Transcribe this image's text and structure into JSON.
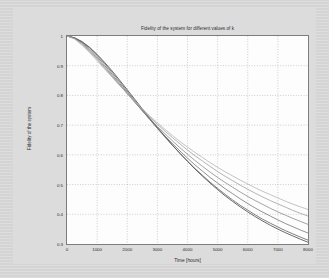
{
  "chart_data": {
    "type": "line",
    "title": "Fidelity of the system for different values of k",
    "xlabel": "Time [hours]",
    "ylabel": "Fidelity of the system",
    "xlim": [
      0,
      8000
    ],
    "ylim": [
      0.3,
      1.0
    ],
    "grid": true,
    "grid_style": "dotted",
    "legend": "none",
    "xticks": [
      0,
      1000,
      2000,
      3000,
      4000,
      5000,
      6000,
      7000,
      8000
    ],
    "xtick_labels": [
      "0",
      "1000",
      "2000",
      "3000",
      "4000",
      "5000",
      "6000",
      "7000",
      "8000"
    ],
    "yticks": [
      0.3,
      0.4,
      0.5,
      0.6,
      0.7,
      0.8,
      0.9,
      1.0
    ],
    "ytick_labels": [
      "0.3",
      "0.4",
      "0.5",
      "0.6",
      "0.7",
      "0.8",
      "0.9",
      "1"
    ],
    "x": [
      0,
      250,
      500,
      750,
      1000,
      1250,
      1500,
      1750,
      2000,
      2250,
      2500,
      2750,
      3000,
      3250,
      3500,
      3750,
      4000,
      4250,
      4500,
      4750,
      5000,
      5250,
      5500,
      5750,
      6000,
      6250,
      6500,
      6750,
      7000,
      7250,
      7500,
      7750,
      8000
    ],
    "series": [
      {
        "name": "k1",
        "color": "#3a3a3a",
        "values": [
          1.0,
          0.994,
          0.981,
          0.962,
          0.938,
          0.911,
          0.882,
          0.851,
          0.819,
          0.787,
          0.755,
          0.723,
          0.692,
          0.662,
          0.633,
          0.605,
          0.578,
          0.552,
          0.528,
          0.505,
          0.483,
          0.462,
          0.443,
          0.425,
          0.408,
          0.392,
          0.377,
          0.363,
          0.35,
          0.338,
          0.327,
          0.316,
          0.306
        ]
      },
      {
        "name": "k2",
        "color": "#555555",
        "values": [
          1.0,
          0.994,
          0.98,
          0.96,
          0.935,
          0.907,
          0.877,
          0.846,
          0.814,
          0.782,
          0.75,
          0.719,
          0.689,
          0.66,
          0.632,
          0.605,
          0.579,
          0.554,
          0.531,
          0.508,
          0.487,
          0.467,
          0.448,
          0.43,
          0.414,
          0.398,
          0.383,
          0.37,
          0.357,
          0.345,
          0.334,
          0.323,
          0.313
        ]
      },
      {
        "name": "k3",
        "color": "#6e6e6e",
        "values": [
          1.0,
          0.993,
          0.978,
          0.956,
          0.93,
          0.901,
          0.871,
          0.84,
          0.809,
          0.778,
          0.748,
          0.719,
          0.691,
          0.664,
          0.638,
          0.613,
          0.589,
          0.566,
          0.545,
          0.524,
          0.505,
          0.486,
          0.469,
          0.452,
          0.436,
          0.421,
          0.407,
          0.394,
          0.381,
          0.369,
          0.358,
          0.347,
          0.337
        ]
      },
      {
        "name": "k4",
        "color": "#848484",
        "values": [
          1.0,
          0.992,
          0.975,
          0.952,
          0.925,
          0.896,
          0.866,
          0.836,
          0.806,
          0.777,
          0.749,
          0.722,
          0.696,
          0.671,
          0.647,
          0.624,
          0.602,
          0.581,
          0.561,
          0.542,
          0.524,
          0.507,
          0.491,
          0.475,
          0.46,
          0.446,
          0.433,
          0.42,
          0.408,
          0.397,
          0.386,
          0.376,
          0.366
        ]
      },
      {
        "name": "k5",
        "color": "#9a9a9a",
        "values": [
          1.0,
          0.991,
          0.972,
          0.948,
          0.921,
          0.892,
          0.863,
          0.834,
          0.806,
          0.779,
          0.752,
          0.727,
          0.703,
          0.68,
          0.658,
          0.637,
          0.616,
          0.597,
          0.579,
          0.561,
          0.544,
          0.528,
          0.513,
          0.498,
          0.484,
          0.471,
          0.458,
          0.446,
          0.435,
          0.424,
          0.413,
          0.403,
          0.394
        ]
      },
      {
        "name": "k6",
        "color": "#b0b0b0",
        "values": [
          1.0,
          0.99,
          0.969,
          0.944,
          0.917,
          0.889,
          0.861,
          0.833,
          0.806,
          0.78,
          0.755,
          0.731,
          0.708,
          0.686,
          0.665,
          0.645,
          0.626,
          0.608,
          0.591,
          0.574,
          0.558,
          0.543,
          0.529,
          0.515,
          0.502,
          0.489,
          0.477,
          0.466,
          0.455,
          0.444,
          0.434,
          0.425,
          0.416
        ]
      }
    ]
  }
}
